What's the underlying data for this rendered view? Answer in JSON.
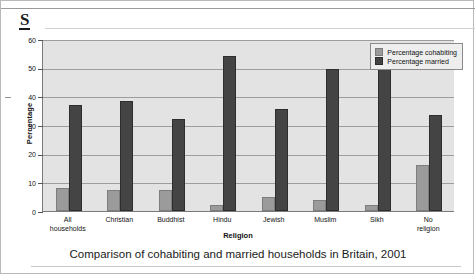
{
  "document": {
    "heading_letter": "S",
    "caption": "Comparison of cohabiting and married households in Britain, 2001"
  },
  "chart_data": {
    "type": "bar",
    "title": "",
    "xlabel": "Religion",
    "ylabel": "Percentage",
    "categories": [
      "All households",
      "Christian",
      "Buddhist",
      "Hindu",
      "Jewish",
      "Muslim",
      "Sikh",
      "No religion"
    ],
    "category_lines": [
      [
        "All",
        "households"
      ],
      [
        "Christian"
      ],
      [
        "Buddhist"
      ],
      [
        "Hindu"
      ],
      [
        "Jewish"
      ],
      [
        "Muslim"
      ],
      [
        "Sikh"
      ],
      [
        "No",
        "religion"
      ]
    ],
    "series": [
      {
        "name": "Percentage cohabiting",
        "color": "#9b9b9b",
        "values": [
          8,
          7.5,
          7.5,
          2,
          5,
          4,
          2,
          16
        ]
      },
      {
        "name": "Percentage married",
        "color": "#444444",
        "values": [
          37,
          38.5,
          32,
          54,
          35.5,
          49.5,
          52,
          33.5
        ]
      }
    ],
    "ylim": [
      0,
      60
    ],
    "yticks": [
      0,
      10,
      20,
      30,
      40,
      50,
      60
    ],
    "ytick_labels": [
      "0",
      "10",
      "20",
      "30",
      "40",
      "50",
      "60"
    ],
    "grid": true,
    "legend_position": "top-right",
    "plot_background": "#e3e3e3"
  }
}
